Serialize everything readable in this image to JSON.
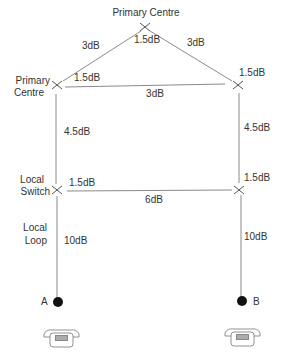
{
  "nodes": {
    "top_primary": {
      "label": "Primary Centre",
      "local_loss": "1.5dB"
    },
    "left_primary": {
      "label_line1": "Primary",
      "label_line2": "Centre",
      "local_loss": "1.5dB"
    },
    "right_primary": {
      "local_loss": "1.5dB"
    },
    "left_local_switch": {
      "label_line1": "Local",
      "label_line2": "Switch",
      "local_loss": "1.5dB"
    },
    "right_local_switch": {
      "local_loss": "1.5dB"
    },
    "subscriber_a": {
      "label": "A"
    },
    "subscriber_b": {
      "label": "B"
    }
  },
  "links": {
    "top_to_left": "3dB",
    "top_to_right": "3dB",
    "left_to_right_primary": "3dB",
    "left_primary_to_switch": "4.5dB",
    "right_primary_to_switch": "4.5dB",
    "switch_to_switch": "6dB",
    "left_local_loop": "10dB",
    "right_local_loop": "10dB"
  },
  "annotations": {
    "local_loop_line1": "Local",
    "local_loop_line2": "Loop"
  },
  "colors": {
    "line": "#8a8a8a",
    "node_mark": "#555555",
    "dot": "#111111",
    "text": "#333333"
  }
}
